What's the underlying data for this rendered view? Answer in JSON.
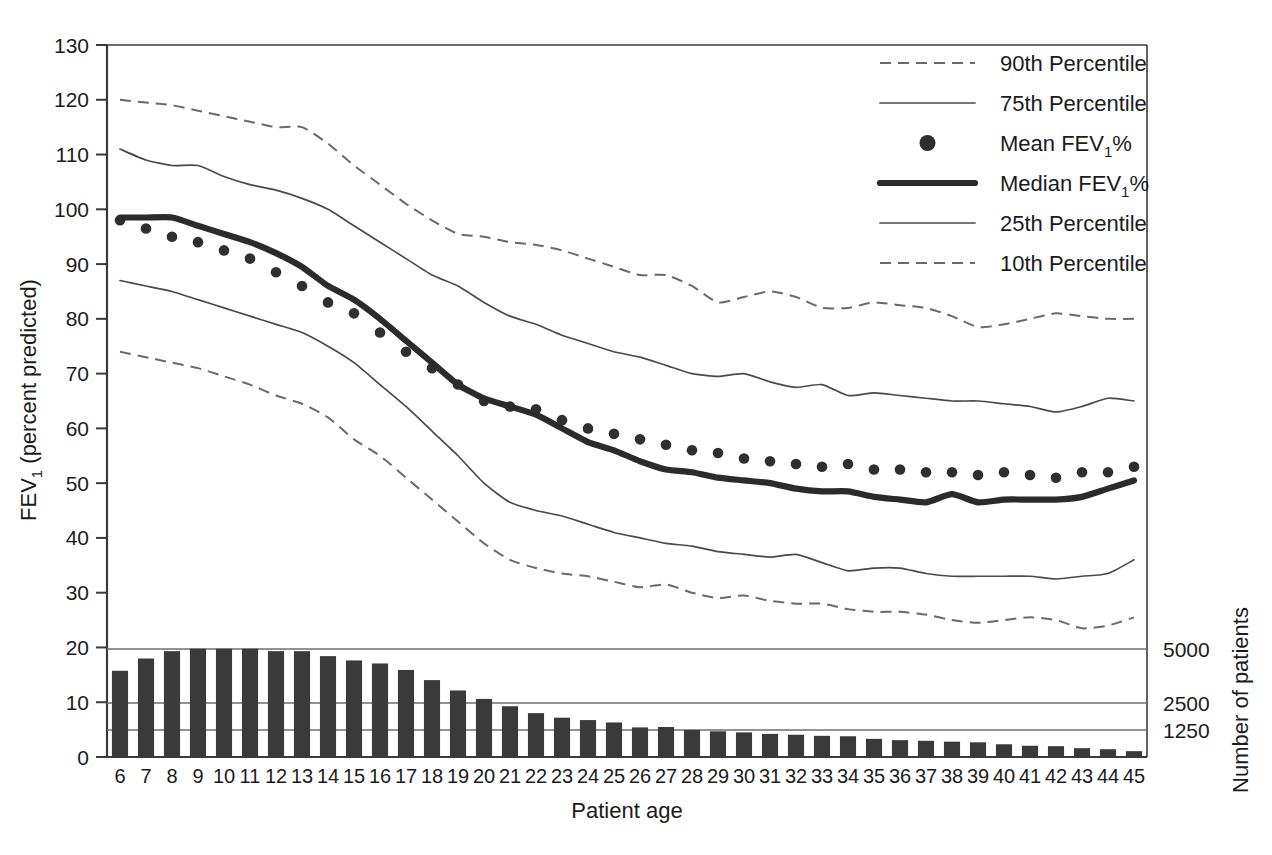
{
  "figure": {
    "background": "#ffffff",
    "ink": "#1b1b1b"
  },
  "axes": {
    "y_left_title_main": "FEV",
    "y_left_title_sub": "1",
    "y_left_title_tail": " (percent predicted)",
    "y_left_ticks": [
      "0",
      "10",
      "20",
      "30",
      "40",
      "50",
      "60",
      "70",
      "80",
      "90",
      "100",
      "110",
      "120",
      "130"
    ],
    "y_left_min": 0,
    "y_left_max": 130,
    "x_title": "Patient age",
    "x_ticks": [
      "6",
      "7",
      "8",
      "9",
      "10",
      "11",
      "12",
      "13",
      "14",
      "15",
      "16",
      "17",
      "18",
      "19",
      "20",
      "21",
      "22",
      "23",
      "24",
      "25",
      "26",
      "27",
      "28",
      "29",
      "30",
      "31",
      "32",
      "33",
      "34",
      "35",
      "36",
      "37",
      "38",
      "39",
      "40",
      "41",
      "42",
      "43",
      "44",
      "45"
    ],
    "x_min": 6,
    "x_max": 45,
    "y_right_title": "Number of patients",
    "y_right_ticks": [
      "5000",
      "2500",
      "1250"
    ],
    "y_right_tick_values": [
      5000,
      2500,
      1250
    ]
  },
  "legend": {
    "position": "top-right",
    "items": [
      {
        "label": "90th Percentile",
        "marker": "dashed-line",
        "color": "#6a6a6a"
      },
      {
        "label": "75th Percentile",
        "marker": "solid-thin-line",
        "color": "#4a4a4a"
      },
      {
        "label_main": "Mean FEV",
        "label_sub": "1",
        "label_tail": "%",
        "label": "Mean FEV1%",
        "marker": "dot",
        "color": "#2f2f2f"
      },
      {
        "label_main": "Median FEV",
        "label_sub": "1",
        "label_tail": "%",
        "label": "Median FEV1%",
        "marker": "solid-thick-line",
        "color": "#2b2b2b"
      },
      {
        "label": "25th Percentile",
        "marker": "solid-thin-line",
        "color": "#4a4a4a"
      },
      {
        "label": "10th Percentile",
        "marker": "dashed-line",
        "color": "#6a6a6a"
      }
    ]
  },
  "chart_data": {
    "type": "line",
    "title": "",
    "xlabel": "Patient age",
    "ylabel": "FEV1 (percent predicted)",
    "y2label": "Number of patients",
    "xlim": [
      6,
      45
    ],
    "ylim": [
      0,
      130
    ],
    "y2lim": [
      0,
      5800
    ],
    "grid": false,
    "x": [
      6,
      7,
      8,
      9,
      10,
      11,
      12,
      13,
      14,
      15,
      16,
      17,
      18,
      19,
      20,
      21,
      22,
      23,
      24,
      25,
      26,
      27,
      28,
      29,
      30,
      31,
      32,
      33,
      34,
      35,
      36,
      37,
      38,
      39,
      40,
      41,
      42,
      43,
      44,
      45
    ],
    "series": [
      {
        "name": "90th Percentile",
        "style": "dashed",
        "values": [
          120,
          119.5,
          119,
          118,
          117,
          116,
          115,
          115,
          112,
          108,
          104.5,
          101,
          98,
          95.5,
          95,
          94,
          93.5,
          92.5,
          91,
          89.5,
          88,
          88,
          86,
          83,
          84,
          85,
          84,
          82,
          82,
          83,
          82.5,
          82,
          80.5,
          78.5,
          79,
          80,
          81,
          80.5,
          80,
          80
        ]
      },
      {
        "name": "75th Percentile",
        "style": "solid-thin",
        "values": [
          111,
          109,
          108,
          108,
          106,
          104.5,
          103.5,
          102,
          100,
          97,
          94,
          91,
          88,
          86,
          83,
          80.5,
          79,
          77,
          75.5,
          74,
          73,
          71.5,
          70,
          69.5,
          70,
          68.5,
          67.5,
          68,
          66,
          66.5,
          66,
          65.5,
          65,
          65,
          64.5,
          64,
          63,
          64,
          65.5,
          65
        ]
      },
      {
        "name": "Mean FEV1%",
        "style": "dots",
        "values": [
          98,
          96.5,
          95,
          94,
          92.5,
          91,
          88.5,
          86,
          83,
          81,
          77.5,
          74,
          71,
          68,
          65,
          64,
          63.5,
          61.5,
          60,
          59,
          58,
          57,
          56,
          55.5,
          54.5,
          54,
          53.5,
          53,
          53.5,
          52.5,
          52.5,
          52,
          52,
          51.5,
          52,
          51.5,
          51,
          52,
          52,
          53
        ]
      },
      {
        "name": "Median FEV1%",
        "style": "solid-thick",
        "values": [
          98.5,
          98.5,
          98.5,
          97,
          95.5,
          94,
          92,
          89.5,
          86,
          83.5,
          80,
          76,
          72,
          68,
          65.5,
          64,
          62.5,
          60,
          57.5,
          56,
          54,
          52.5,
          52,
          51,
          50.5,
          50,
          49,
          48.5,
          48.5,
          47.5,
          47,
          46.5,
          48,
          46.5,
          47,
          47,
          47,
          47.5,
          49,
          50.5
        ]
      },
      {
        "name": "25th Percentile",
        "style": "solid-thin",
        "values": [
          87,
          86,
          85,
          83.5,
          82,
          80.5,
          79,
          77.5,
          75,
          72,
          68,
          64,
          59.5,
          55,
          50,
          46.5,
          45,
          44,
          42.5,
          41,
          40,
          39,
          38.5,
          37.5,
          37,
          36.5,
          37,
          35.5,
          34,
          34.5,
          34.5,
          33.5,
          33,
          33,
          33,
          33,
          32.5,
          33,
          33.5,
          36
        ]
      },
      {
        "name": "10th Percentile",
        "style": "dashed",
        "values": [
          74,
          73,
          72,
          71,
          69.5,
          68,
          66,
          64.5,
          62,
          58,
          55,
          51,
          47,
          43,
          39,
          36,
          34.5,
          33.5,
          33,
          32,
          31,
          31.5,
          30,
          29,
          29.5,
          28.5,
          28,
          28,
          27,
          26.5,
          26.5,
          26,
          25,
          24.5,
          25,
          25.5,
          25,
          23.5,
          24,
          25.5
        ]
      }
    ],
    "bars": {
      "name": "Number of patients",
      "axis": "right",
      "values_percent_scale": [
        17.5,
        20,
        21.5,
        22,
        22,
        22,
        21.5,
        21.5,
        20.5,
        19.6,
        19,
        17.7,
        15.6,
        13.5,
        11.8,
        10.3,
        8.9,
        8,
        7.5,
        7,
        6,
        6.1,
        5.5,
        5.2,
        5,
        4.7,
        4.5,
        4.3,
        4.2,
        3.7,
        3.4,
        3.3,
        3.1,
        3,
        2.6,
        2.3,
        2.2,
        1.8,
        1.6,
        1.2
      ],
      "values_patients": [
        3990,
        4560,
        4900,
        5010,
        5010,
        5010,
        4900,
        4900,
        4670,
        4470,
        4330,
        4030,
        3560,
        3080,
        2690,
        2350,
        2030,
        1820,
        1710,
        1600,
        1370,
        1390,
        1250,
        1190,
        1140,
        1070,
        1030,
        980,
        960,
        840,
        780,
        750,
        710,
        680,
        590,
        520,
        500,
        410,
        360,
        270
      ]
    }
  }
}
